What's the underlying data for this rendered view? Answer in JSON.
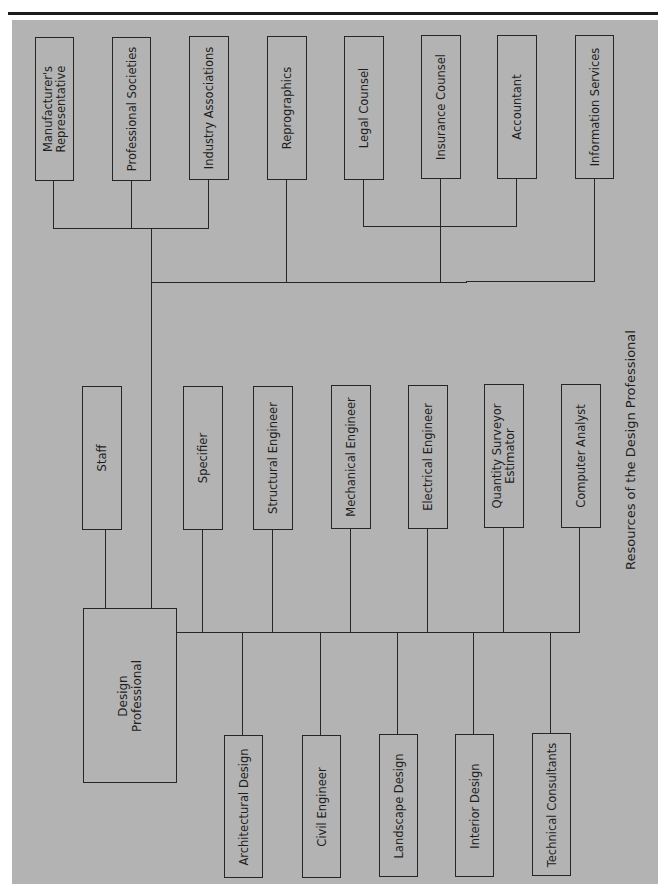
{
  "title": "Resources of the Design Professional",
  "center_node": {
    "label_line1": "Design",
    "label_line2": "Professional"
  },
  "top_row": [
    {
      "label_line1": "Manufacturer's",
      "label_line2": "Representative"
    },
    {
      "label": "Professional Societies"
    },
    {
      "label": "Industry Associations"
    },
    {
      "label": "Reprographics"
    },
    {
      "label": "Legal Counsel"
    },
    {
      "label": "Insurance Counsel"
    },
    {
      "label": "Accountant"
    },
    {
      "label": "Information Services"
    }
  ],
  "middle_row": [
    {
      "label": "Staff"
    },
    {
      "label": "Specifier"
    },
    {
      "label": "Structural Engineer"
    },
    {
      "label": "Mechanical Engineer"
    },
    {
      "label": "Electrical Engineer"
    },
    {
      "label_line1": "Quantity Surveyor",
      "label_line2": "Estimator"
    },
    {
      "label": "Computer Analyst"
    }
  ],
  "bottom_row": [
    {
      "label": "Architectural Design"
    },
    {
      "label": "Civil Engineer"
    },
    {
      "label": "Landscape Design"
    },
    {
      "label": "Interior Design"
    },
    {
      "label": "Technical Consultants"
    }
  ],
  "colors": {
    "panel": "#b3b3b3",
    "line": "#262626",
    "text": "#1e1e1e"
  }
}
